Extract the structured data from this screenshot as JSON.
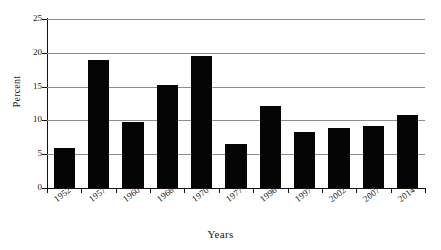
{
  "chart_data": {
    "type": "bar",
    "title": "",
    "xlabel": "Years",
    "ylabel": "Percent",
    "categories": [
      "1952",
      "1957",
      "1960",
      "1966",
      "1970",
      "1977",
      "1996",
      "1997",
      "2002",
      "2007",
      "2014"
    ],
    "values": [
      5.9,
      18.9,
      9.8,
      15.2,
      19.6,
      6.5,
      12.2,
      8.3,
      8.9,
      9.2,
      10.8
    ],
    "ylim": [
      0,
      25
    ],
    "yticks": [
      0,
      5,
      10,
      15,
      20,
      25
    ],
    "ytick_labels": [
      "0",
      "5",
      "10",
      "15",
      "20",
      "25"
    ],
    "grid": "horizontal",
    "legend": "none",
    "bar_color": "#050505",
    "grid_color": "#8d8d8d",
    "axis_color": "#111111",
    "background": "#ffffff"
  }
}
